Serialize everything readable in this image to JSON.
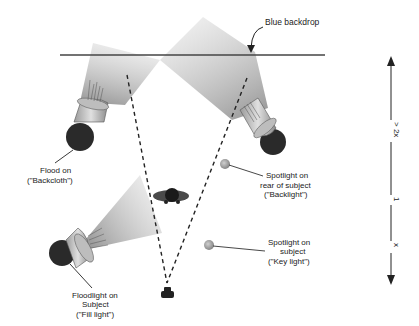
{
  "colors": {
    "line": "#444444",
    "lamp_body": "#c8c8c8",
    "lamp_base": "#2a2a2a",
    "beam": "#9a9a9a",
    "subject": "#444444",
    "spot": "#a0a0a0"
  },
  "backdrop": {
    "label": "Blue backdrop"
  },
  "lights": [
    {
      "id": "flood-backcloth",
      "lines": [
        "Flood on",
        "(\"Backcloth\")"
      ]
    },
    {
      "id": "spot-backlight",
      "lines": [
        "Spotlight on",
        "rear of subject",
        "(\"Backlight\")"
      ]
    },
    {
      "id": "spot-keylight",
      "lines": [
        "Spotlight on",
        "subject",
        "(\"Key light\")"
      ]
    },
    {
      "id": "flood-filllight",
      "lines": [
        "Floodlight on",
        "Subject",
        "(\"Fill light\")"
      ]
    }
  ],
  "scale": {
    "top_label": "> 2x",
    "middle_label": "1",
    "bottom_label": "x"
  }
}
